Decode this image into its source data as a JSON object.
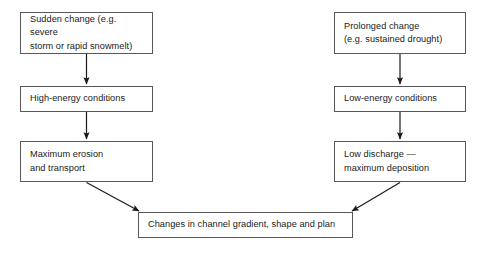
{
  "diagram": {
    "line_color": "#58585a",
    "text_color": "#1a1a1a",
    "background": "#ffffff",
    "nodes": [
      {
        "id": "sudden-change",
        "label": "Sudden change (e.g. severe\nstorm or rapid snowmelt)",
        "column": "left",
        "level": 1
      },
      {
        "id": "high-energy",
        "label": "High-energy conditions",
        "column": "left",
        "level": 2
      },
      {
        "id": "max-erosion",
        "label": "Maximum erosion\nand transport",
        "column": "left",
        "level": 3
      },
      {
        "id": "prolonged-change",
        "label": "Prolonged change\n(e.g. sustained drought)",
        "column": "right",
        "level": 1
      },
      {
        "id": "low-energy",
        "label": "Low-energy conditions",
        "column": "right",
        "level": 2
      },
      {
        "id": "low-discharge",
        "label": "Low discharge —\nmaximum deposition",
        "column": "right",
        "level": 3
      },
      {
        "id": "changes-channel",
        "label": "Changes in channel gradient, shape and plan",
        "column": "center",
        "level": 4
      }
    ],
    "connectors": [
      {
        "id": "sudden-to-high",
        "from": "sudden-change",
        "to": "high-energy",
        "kind": "vertical-arrow"
      },
      {
        "id": "high-to-erosion",
        "from": "high-energy",
        "to": "max-erosion",
        "kind": "vertical-arrow"
      },
      {
        "id": "erosion-to-changes",
        "from": "max-erosion",
        "to": "changes-channel",
        "kind": "diagonal-arrow"
      },
      {
        "id": "prolonged-to-low",
        "from": "prolonged-change",
        "to": "low-energy",
        "kind": "vertical-arrow"
      },
      {
        "id": "low-to-discharge",
        "from": "low-energy",
        "to": "low-discharge",
        "kind": "vertical-arrow"
      },
      {
        "id": "discharge-to-changes",
        "from": "low-discharge",
        "to": "changes-channel",
        "kind": "diagonal-arrow"
      }
    ]
  }
}
